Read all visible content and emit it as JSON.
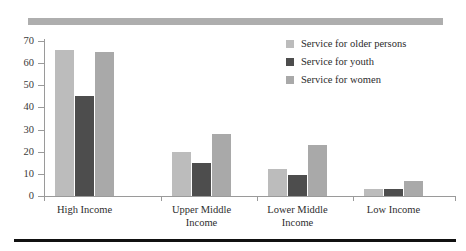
{
  "chart_data": {
    "type": "bar",
    "title": "",
    "subtitle": "",
    "xlabel": "",
    "ylabel": "",
    "ylim": [
      0,
      70
    ],
    "ytick_labels": [
      "0",
      "10",
      "20",
      "30",
      "40",
      "50",
      "60",
      "70"
    ],
    "ytick_values": [
      0,
      10,
      20,
      30,
      40,
      50,
      60,
      70
    ],
    "grid": false,
    "legend_position": "top-right",
    "categories": [
      "High Income",
      "Upper Middle\nIncome",
      "Lower Middle\nIncome",
      "Low Income"
    ],
    "series": [
      {
        "name": "Service for older persons",
        "color": "#bcbcbc",
        "values": [
          66,
          20,
          12,
          3
        ]
      },
      {
        "name": "Service for youth",
        "color": "#4d4d4d",
        "values": [
          45,
          15,
          9.5,
          3
        ]
      },
      {
        "name": "Service for women",
        "color": "#a9a9a9",
        "values": [
          65,
          28,
          23,
          7
        ]
      }
    ]
  },
  "decor": {
    "top_band_color": "#aeaeae",
    "bottom_rule_color": "#111111",
    "axis_color": "#9a9a9a"
  }
}
